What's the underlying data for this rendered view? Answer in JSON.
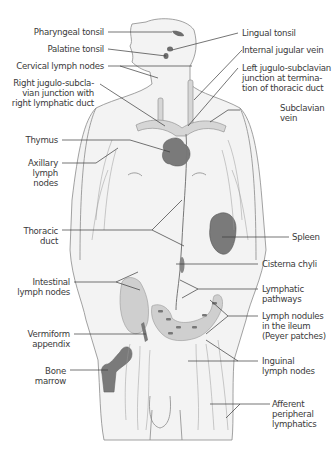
{
  "figure": {
    "colors": {
      "body_fill": "#f2f2f2",
      "outline": "#777777",
      "organ_fill": "#7a7a7a",
      "organ_light": "#c9c9c9",
      "leader": "#3a3a3a",
      "text": "#3a3a3a"
    }
  },
  "labels": {
    "left": [
      {
        "id": "pharyngeal_tonsil",
        "text": "Pharyngeal tonsil"
      },
      {
        "id": "palatine_tonsil",
        "text": "Palatine tonsil"
      },
      {
        "id": "cervical_lymph_nodes",
        "text": "Cervical lymph nodes"
      },
      {
        "id": "right_jugulo_subclavian",
        "text": "Right jugulo-subcla-\nvian junction with\nright  lymphatic duct"
      },
      {
        "id": "thymus",
        "text": "Thymus"
      },
      {
        "id": "axillary_lymph_nodes",
        "text": "Axillary\nlymph\nnodes"
      },
      {
        "id": "thoracic_duct",
        "text": "Thoracic\nduct"
      },
      {
        "id": "intestinal_lymph_nodes",
        "text": "Intestinal\nlymph nodes"
      },
      {
        "id": "vermiform_appendix",
        "text": "Vermiform\nappendix"
      },
      {
        "id": "bone_marrow",
        "text": "Bone\nmarrow"
      }
    ],
    "right": [
      {
        "id": "lingual_tonsil",
        "text": "Lingual tonsil"
      },
      {
        "id": "internal_jugular_vein",
        "text": "Internal jugular vein"
      },
      {
        "id": "left_jugulo_subclavian",
        "text": "Left jugulo-subclavian\njunction at termina-\ntion of thoracic duct"
      },
      {
        "id": "subclavian_vein",
        "text": "Subclavian\nvein"
      },
      {
        "id": "spleen",
        "text": "Spleen"
      },
      {
        "id": "cisterna_chyli",
        "text": "Cisterna chyli"
      },
      {
        "id": "lymphatic_pathways",
        "text": "Lymphatic\npathways"
      },
      {
        "id": "lymph_nodules_ileum",
        "text": "Lymph nodules\nin the ileum\n(Peyer patches)"
      },
      {
        "id": "inguinal_lymph_nodes",
        "text": "Inguinal\nlymph nodes"
      },
      {
        "id": "afferent_peripheral_lymphatics",
        "text": "Afferent\nperipheral\nlymphatics"
      }
    ]
  }
}
